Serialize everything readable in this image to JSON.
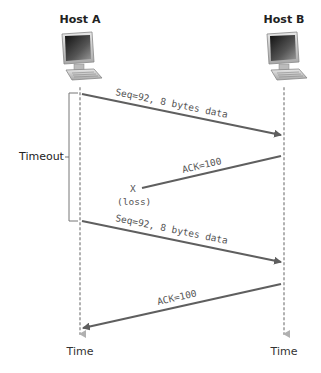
{
  "hosts": {
    "a": {
      "label": "Host A",
      "x": 80
    },
    "b": {
      "label": "Host B",
      "x": 284
    }
  },
  "timeout": {
    "label": "Timeout"
  },
  "time_labels": {
    "a": "Time",
    "b": "Time"
  },
  "messages": [
    {
      "from": "Host A",
      "to": "Host B",
      "label": "Seq=92, 8 bytes data",
      "delivered": true
    },
    {
      "from": "Host B",
      "to": "Host A",
      "label": "ACK=100",
      "delivered": false
    },
    {
      "from": "Host A",
      "to": "Host B",
      "label": "Seq=92, 8 bytes data",
      "delivered": true
    },
    {
      "from": "Host B",
      "to": "Host A",
      "label": "ACK=100",
      "delivered": true
    }
  ],
  "loss": {
    "marker": "X",
    "label": "(loss)"
  },
  "colors": {
    "arrow": "#5f5f5f",
    "timeline": "#b0b0b0",
    "bracket": "#777777"
  }
}
